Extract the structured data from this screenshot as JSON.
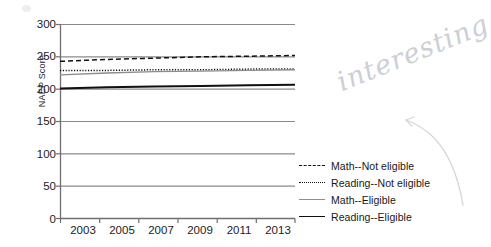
{
  "chart_data": {
    "type": "line",
    "title": "",
    "xlabel": "",
    "ylabel": "NAEP Score",
    "x": [
      2003,
      2005,
      2007,
      2009,
      2011,
      2013
    ],
    "xlim": [
      2002,
      2014
    ],
    "ylim": [
      0,
      300
    ],
    "yticks": [
      0,
      50,
      100,
      150,
      200,
      250,
      300
    ],
    "xticks": [
      2003,
      2005,
      2007,
      2009,
      2011,
      2013
    ],
    "grid": true,
    "legend_position": "right",
    "series": [
      {
        "name": "Math--Not eligible",
        "style": "dashed",
        "color": "#111111",
        "values": [
          243,
          246,
          248,
          250,
          251,
          252
        ]
      },
      {
        "name": "Reading--Not eligible",
        "style": "dotted",
        "color": "#111111",
        "values": [
          229,
          229,
          230,
          230,
          231,
          231
        ]
      },
      {
        "name": "Math--Eligible",
        "style": "solid-light",
        "color": "#8d8d8d",
        "values": [
          222,
          225,
          227,
          228,
          229,
          230
        ]
      },
      {
        "name": "Reading--Eligible",
        "style": "solid-dark",
        "color": "#111111",
        "values": [
          201,
          203,
          204,
          205,
          206,
          207
        ]
      }
    ]
  },
  "axis": {
    "y_title": "NAEP Score",
    "y_tick_labels": [
      "300",
      "250",
      "200",
      "150",
      "100",
      "50",
      "0"
    ],
    "x_tick_labels": [
      "2003",
      "2005",
      "2007",
      "2009",
      "2011",
      "2013"
    ]
  },
  "legend": {
    "items": [
      {
        "label": "Math--Not eligible",
        "swatch": "dashed-line-icon"
      },
      {
        "label": "Reading--Not eligible",
        "swatch": "dotted-line-icon"
      },
      {
        "label": "Math--Eligible",
        "swatch": "solid-gray-line-icon"
      },
      {
        "label": "Reading--Eligible",
        "swatch": "solid-black-line-icon"
      }
    ]
  },
  "annotation": {
    "handwritten_note": "interesting"
  },
  "colors": {
    "grid": "#8a8a8a",
    "axis": "#6f6f6f",
    "series_dark": "#111111",
    "series_light": "#8d8d8d",
    "handwriting": "#c9cdd4"
  }
}
